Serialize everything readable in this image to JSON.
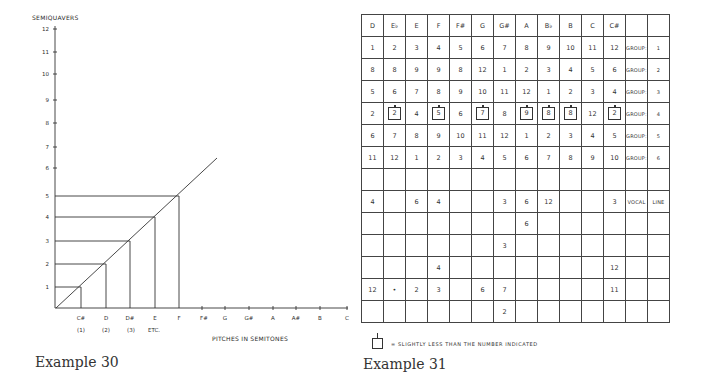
{
  "example30": {
    "caption": "Example 30",
    "y_axis_label": "SEMIQUAVERS",
    "x_axis_label": "PITCHES IN SEMITONES",
    "y_ticks": [
      "1",
      "2",
      "3",
      "4",
      "5",
      "6",
      "7",
      "8",
      "9",
      "10",
      "11",
      "12"
    ],
    "x_ticks": [
      "C#",
      "D",
      "D#",
      "E",
      "F",
      "F#",
      "G",
      "G#",
      "A",
      "A#",
      "B",
      "C"
    ],
    "x_sub_labels": [
      "(1)",
      "(2)",
      "(3)",
      "ETC."
    ]
  },
  "chart_data": {
    "type": "line",
    "title": "Example 30",
    "xlabel": "PITCHES IN SEMITONES",
    "ylabel": "SEMIQUAVERS",
    "categories": [
      "C#",
      "D",
      "D#",
      "E",
      "F",
      "F#",
      "G",
      "G#",
      "A",
      "A#",
      "B",
      "C"
    ],
    "series": [
      {
        "name": "pitch-to-duration mapping",
        "x": [
          0,
          1,
          2,
          3,
          4,
          5,
          6
        ],
        "values": [
          0,
          1,
          2,
          3,
          4,
          5,
          6
        ]
      }
    ],
    "highlighted_points": [
      {
        "x": "C#",
        "y": 1
      },
      {
        "x": "D",
        "y": 2
      },
      {
        "x": "D#",
        "y": 3
      },
      {
        "x": "E",
        "y": 4
      },
      {
        "x": "F",
        "y": 5
      }
    ],
    "ylim": [
      0,
      12
    ],
    "grid": false
  },
  "example31": {
    "caption": "Example 31",
    "legend_text": "= SLIGHTLY LESS THAN THE NUMBER INDICATED",
    "header": [
      "D",
      "E♭",
      "E",
      "F",
      "F#",
      "G",
      "G#",
      "A",
      "B♭",
      "B",
      "C",
      "C#",
      "",
      ""
    ],
    "rows": [
      [
        "1",
        "2",
        "3",
        "4",
        "5",
        "6",
        "7",
        "8",
        "9",
        "10",
        "11",
        "12",
        "GROUP:",
        "1"
      ],
      [
        "8",
        "8",
        "9",
        "9",
        "8",
        "12",
        "1",
        "2",
        "3",
        "4",
        "5",
        "6",
        "GROUP:",
        "2"
      ],
      [
        "5",
        "6",
        "7",
        "8",
        "9",
        "10",
        "11",
        "12",
        "1",
        "2",
        "3",
        "4",
        "GROUP:",
        "3"
      ],
      [
        "2",
        "[2]",
        "4",
        "[5]",
        "6",
        "[7]",
        "8",
        "[9]",
        "[8]",
        "[8]",
        "12",
        "[2]",
        "GROUP:",
        "4"
      ],
      [
        "6",
        "7",
        "8",
        "9",
        "10",
        "11",
        "12",
        "1",
        "2",
        "3",
        "4",
        "5",
        "GROUP:",
        "5"
      ],
      [
        "11",
        "12",
        "1",
        "2",
        "3",
        "4",
        "5",
        "6",
        "7",
        "8",
        "9",
        "10",
        "GROUP:",
        "6"
      ],
      [
        "",
        "",
        "",
        "",
        "",
        "",
        "",
        "",
        "",
        "",
        "",
        "",
        "",
        ""
      ],
      [
        "4",
        "",
        "6",
        "4",
        "",
        "",
        "3",
        "6",
        "12",
        "",
        "",
        "3",
        "VOCAL",
        "LINE"
      ],
      [
        "",
        "",
        "",
        "",
        "",
        "",
        "",
        "6",
        "",
        "",
        "",
        "",
        "",
        ""
      ],
      [
        "",
        "",
        "",
        "",
        "",
        "",
        "3",
        "",
        "",
        "",
        "",
        "",
        "",
        ""
      ],
      [
        "",
        "",
        "",
        "4",
        "",
        "",
        "",
        "",
        "",
        "",
        "",
        "12",
        "",
        ""
      ],
      [
        "12",
        "•",
        "2",
        "3",
        "",
        "6",
        "7",
        "",
        "",
        "",
        "",
        "11",
        "",
        ""
      ],
      [
        "",
        "",
        "",
        "",
        "",
        "",
        "2",
        "",
        "",
        "",
        "",
        "",
        "",
        ""
      ]
    ]
  }
}
